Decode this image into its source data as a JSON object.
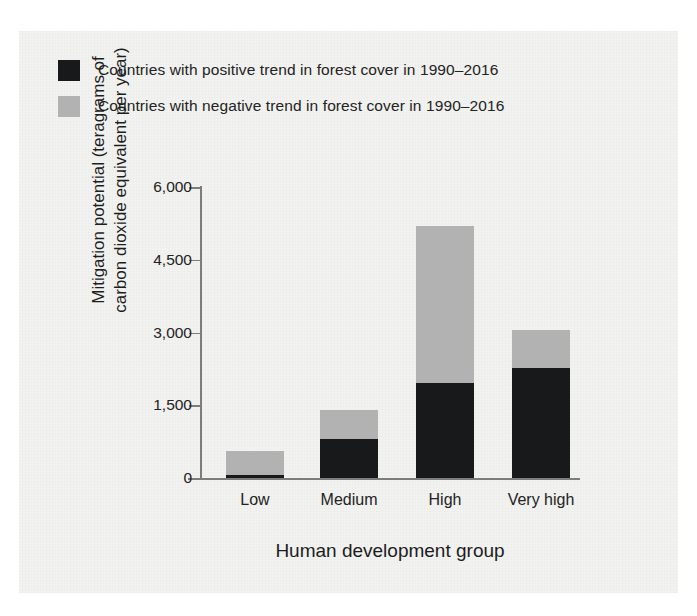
{
  "figure": {
    "background_color": "#f2f2f0"
  },
  "legend": {
    "position": "top-left",
    "items": [
      {
        "label": "Countries with positive trend in forest cover in 1990–2016",
        "color": "#17191a",
        "swatch_name": "legend-swatch-positive"
      },
      {
        "label": "Countries with negative trend in forest cover in 1990–2016",
        "color": "#b2b2b2",
        "swatch_name": "legend-swatch-negative"
      }
    ]
  },
  "axes": {
    "ylabel_line1": "Mitigation potential (teragrams of",
    "ylabel_line2": "carbon dioxide equivalent per year)",
    "xlabel": "Human development group",
    "yticklabels": [
      "0",
      "1,500",
      "3,000",
      "4,500",
      "6,000"
    ],
    "xticklabels": [
      "Low",
      "Medium",
      "High",
      "Very high"
    ]
  },
  "chart_data": {
    "type": "bar",
    "subtype": "stacked-bar",
    "title": "",
    "xlabel": "Human development group",
    "ylabel": "Mitigation potential (teragrams of carbon dioxide equivalent per year)",
    "categories": [
      "Low",
      "Medium",
      "High",
      "Very high"
    ],
    "series": [
      {
        "name": "Countries with positive trend in forest cover in 1990–2016",
        "color": "#17191a",
        "values": [
          70,
          810,
          1950,
          2260
        ]
      },
      {
        "name": "Countries with negative trend in forest cover in 1990–2016",
        "color": "#b2b2b2",
        "values": [
          480,
          600,
          3250,
          790
        ]
      }
    ],
    "totals": [
      550,
      1410,
      5200,
      3050
    ],
    "ylim": [
      0,
      6000
    ],
    "yticks": [
      0,
      1500,
      3000,
      4500,
      6000
    ],
    "yticklabels": [
      "0",
      "1,500",
      "3,000",
      "4,500",
      "6,000"
    ],
    "grid": false,
    "legend_position": "upper-left"
  }
}
